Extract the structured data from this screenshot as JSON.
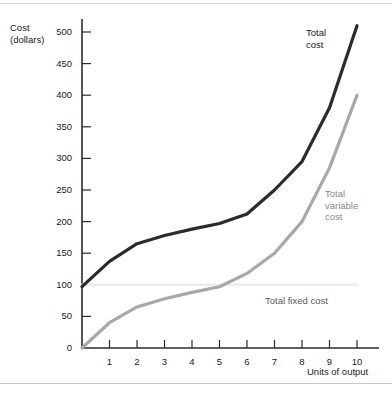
{
  "figure": {
    "top_rule": "",
    "bottom_rule": ""
  },
  "chart_data": {
    "type": "line",
    "title": "",
    "subtitle": "",
    "xlabel": "Units of output",
    "ylabel": "Cost\n(dollars)",
    "ylabel_line1": "Cost",
    "ylabel_line2": "(dollars)",
    "xlim": [
      0,
      10.8
    ],
    "ylim": [
      0,
      530
    ],
    "grid": false,
    "legend_position": "inline-annotations",
    "x": [
      0,
      1,
      2,
      3,
      4,
      5,
      6,
      7,
      8,
      9,
      10
    ],
    "xticks": [
      1,
      2,
      3,
      4,
      5,
      6,
      7,
      8,
      9,
      10
    ],
    "xtick_labels": [
      "1",
      "2",
      "3",
      "4",
      "5",
      "6",
      "7",
      "8",
      "9",
      "10"
    ],
    "yticks": [
      0,
      50,
      100,
      150,
      200,
      250,
      300,
      350,
      400,
      450,
      500
    ],
    "ytick_labels": [
      "0",
      "50",
      "100",
      "150",
      "200",
      "250",
      "300",
      "350",
      "400",
      "450",
      "500"
    ],
    "series": [
      {
        "name": "Total cost",
        "color": "#2b2b2b",
        "width": 3.2,
        "values": [
          97,
          137,
          165,
          178,
          188,
          197,
          212,
          250,
          295,
          380,
          510
        ]
      },
      {
        "name": "Total variable cost",
        "color": "#a8a8a8",
        "width": 3.2,
        "values": [
          0,
          40,
          65,
          78,
          88,
          97,
          118,
          150,
          200,
          285,
          400
        ]
      },
      {
        "name": "Total fixed cost",
        "color": "#ececec",
        "width": 2.4,
        "values": [
          100,
          100,
          100,
          100,
          100,
          100,
          100,
          100,
          100,
          100,
          100
        ]
      }
    ],
    "annotations": [
      {
        "text": "Total\ncost",
        "line1": "Total",
        "line2": "cost",
        "series": "Total cost"
      },
      {
        "text": "Total\nvariable\ncost",
        "line1": "Total",
        "line2": "variable",
        "line3": "cost",
        "series": "Total variable cost"
      },
      {
        "text": "Total fixed cost",
        "line1": "Total fixed cost",
        "series": "Total fixed cost"
      }
    ]
  },
  "axes": {
    "y_axis_color": "#2b2b2b",
    "x_axis_color": "#2b2b2b"
  }
}
